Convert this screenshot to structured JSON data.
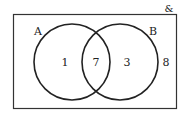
{
  "diagram": {
    "type": "venn",
    "universal_symbol": "&",
    "sets": [
      {
        "name": "A",
        "only_count": "1"
      },
      {
        "name": "B",
        "only_count": "3"
      }
    ],
    "intersection_count": "7",
    "outside_count": "8"
  },
  "colors": {
    "stroke": "#222222",
    "background": "#ffffff"
  }
}
